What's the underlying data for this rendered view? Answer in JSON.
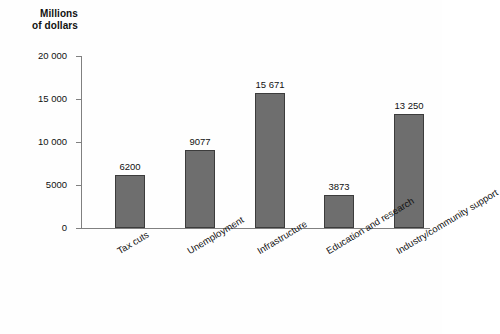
{
  "chart_data": {
    "type": "bar",
    "title": "",
    "subtitle": "",
    "xlabel": "",
    "ylabel": "Millions\nof dollars",
    "ylim": [
      0,
      20000
    ],
    "grid": false,
    "legend": null,
    "categories": [
      "Tax cuts",
      "Unemployment",
      "Infrastructure",
      "Education and research",
      "Industry/community support"
    ],
    "values": [
      6200,
      9077,
      15671,
      3873,
      13250
    ],
    "value_labels": [
      "6200",
      "9077",
      "15 671",
      "3873",
      "13 250"
    ],
    "y_ticks": [
      0,
      5000,
      10000,
      15000,
      20000
    ],
    "y_tick_labels": [
      "0",
      "5000",
      "10 000",
      "15 000",
      "20 000"
    ],
    "colors": {
      "bar_fill": "#6e6e6e",
      "bar_border": "#3c3c3c",
      "axis": "#808080",
      "text": "#111111",
      "background": "#fefefe"
    }
  }
}
